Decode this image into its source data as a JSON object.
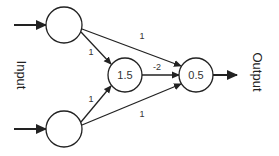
{
  "diagram": {
    "type": "neural-network",
    "labels": {
      "input": "Input",
      "output": "Output"
    },
    "nodes": [
      {
        "id": "in1",
        "label": "",
        "role": "input"
      },
      {
        "id": "in2",
        "label": "",
        "role": "input"
      },
      {
        "id": "hidden",
        "label": "1.5",
        "role": "hidden"
      },
      {
        "id": "out",
        "label": "0.5",
        "role": "output"
      }
    ],
    "edges": [
      {
        "from": "in1",
        "to": "hidden",
        "weight": "1"
      },
      {
        "from": "in2",
        "to": "hidden",
        "weight": "1"
      },
      {
        "from": "in1",
        "to": "out",
        "weight": "1"
      },
      {
        "from": "in2",
        "to": "out",
        "weight": "1"
      },
      {
        "from": "hidden",
        "to": "out",
        "weight": "-2"
      }
    ],
    "colors": {
      "stroke": "#222222",
      "background": "#ffffff"
    }
  }
}
